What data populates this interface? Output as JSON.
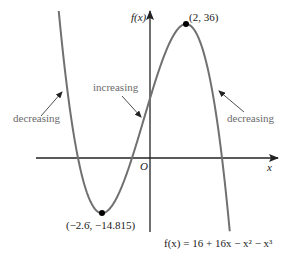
{
  "figure": {
    "function_label": "f(x) = 16 + 16x − x² − x³",
    "y_axis_label": "f(x)",
    "x_axis_label": "x",
    "origin_label": "O",
    "max_point_label": "(2, 36)",
    "min_point_label": "(−2.6̇, −14.815)",
    "annotations": {
      "left": "decreasing",
      "middle": "increasing",
      "right": "decreasing"
    },
    "colors": {
      "curve": "#707070",
      "axes": "#222222",
      "annotation_text": "#6b6b6b",
      "points": "#000000"
    }
  },
  "chart_data": {
    "type": "line",
    "title": "",
    "function": "f(x) = 16 + 16x - x^2 - x^3",
    "xlabel": "x",
    "ylabel": "f(x)",
    "key_points": [
      {
        "name": "local maximum",
        "x": 2,
        "y": 36
      },
      {
        "name": "local minimum",
        "x": -2.667,
        "y": -14.815
      }
    ],
    "roots": [
      -4,
      -1,
      4
    ],
    "y_intercept": 16,
    "intervals": [
      {
        "range": "x < -2.667",
        "behavior": "decreasing"
      },
      {
        "range": "-2.667 < x < 2",
        "behavior": "increasing"
      },
      {
        "range": "x > 2",
        "behavior": "decreasing"
      }
    ],
    "xlim": [
      -5.07,
      4.43
    ]
  }
}
